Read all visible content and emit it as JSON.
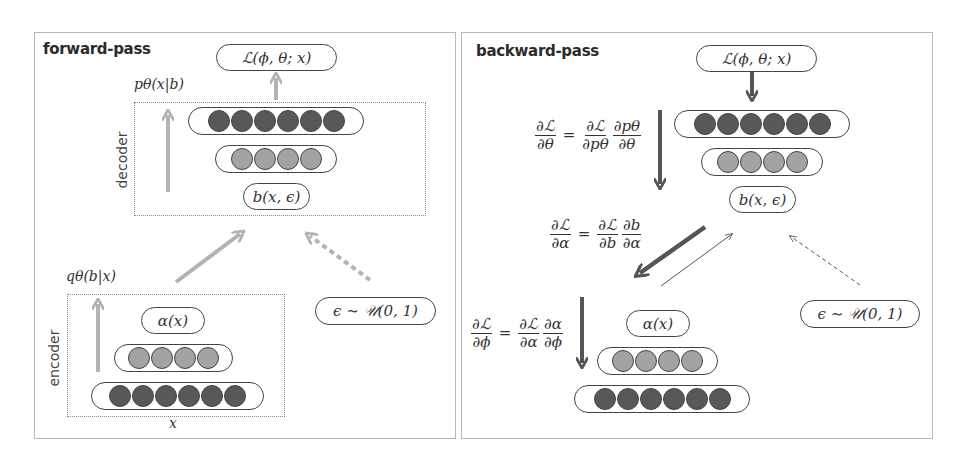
{
  "forward": {
    "title": "forward-pass",
    "loss": "ℒ(ϕ, θ; x)",
    "decoder_label": "decoder",
    "decoder_dist": "pθ(x|b)",
    "decoder_layers": [
      6,
      4
    ],
    "latent": "b(x, ϵ)",
    "encoder_label": "encoder",
    "encoder_dist": "qθ(b|x)",
    "encoder_output": "α(x)",
    "encoder_layers": [
      4,
      6
    ],
    "input": "x",
    "noise": "ϵ ∼ 𝒰(0, 1)"
  },
  "backward": {
    "title": "backward-pass",
    "loss": "ℒ(ϕ, θ; x)",
    "decoder_layers": [
      6,
      4
    ],
    "latent": "b(x, ϵ)",
    "encoder_output": "α(x)",
    "encoder_layers": [
      4,
      6
    ],
    "noise": "ϵ ∼ 𝒰(0, 1)",
    "eq_theta": {
      "lhs_num": "∂ℒ",
      "lhs_den": "∂θ",
      "r1_num": "∂ℒ",
      "r1_den": "∂pθ",
      "r2_num": "∂pθ",
      "r2_den": "∂θ"
    },
    "eq_alpha": {
      "lhs_num": "∂ℒ",
      "lhs_den": "∂α",
      "r1_num": "∂ℒ",
      "r1_den": "∂b",
      "r2_num": "∂b",
      "r2_den": "∂α"
    },
    "eq_phi": {
      "lhs_num": "∂ℒ",
      "lhs_den": "∂ϕ",
      "r1_num": "∂ℒ",
      "r1_den": "∂α",
      "r2_num": "∂α",
      "r2_den": "∂ϕ"
    },
    "equals": "="
  },
  "colors": {
    "forward_arrow": "#b3b3b3",
    "backward_arrow": "#555555",
    "node_dark": "#585858",
    "node_light": "#a3a3a3"
  }
}
